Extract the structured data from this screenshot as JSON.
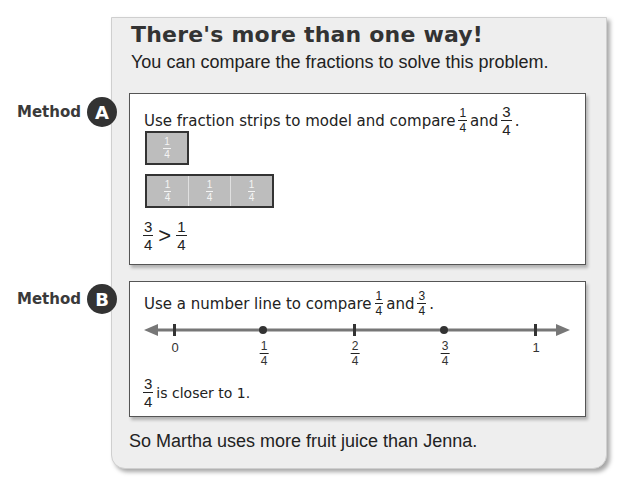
{
  "panel": {
    "title": "There's more than one way!",
    "subtitle": "You can compare the fractions to solve this problem.",
    "footer": "So Martha uses more fruit juice than Jenna."
  },
  "method_a": {
    "label_word": "Method",
    "badge": "A",
    "instruction_prefix": "Use fraction strips to model and compare",
    "instruction_mid": "and",
    "instruction_suffix": ".",
    "fraction1": {
      "num": "1",
      "den": "4"
    },
    "fraction2": {
      "num": "3",
      "den": "4"
    },
    "strip_one": [
      {
        "num": "1",
        "den": "4"
      }
    ],
    "strip_three": [
      {
        "num": "1",
        "den": "4"
      },
      {
        "num": "1",
        "den": "4"
      },
      {
        "num": "1",
        "den": "4"
      }
    ],
    "comparison": {
      "left": {
        "num": "3",
        "den": "4"
      },
      "operator": ">",
      "right": {
        "num": "1",
        "den": "4"
      }
    }
  },
  "method_b": {
    "label_word": "Method",
    "badge": "B",
    "instruction_prefix": "Use a number line to compare",
    "instruction_mid": "and",
    "instruction_suffix": ".",
    "fraction1": {
      "num": "1",
      "den": "4"
    },
    "fraction2": {
      "num": "3",
      "den": "4"
    },
    "number_line": {
      "ticks": [
        {
          "label": "0",
          "type": "tick"
        },
        {
          "num": "1",
          "den": "4",
          "type": "point"
        },
        {
          "num": "2",
          "den": "4",
          "type": "tick"
        },
        {
          "num": "3",
          "den": "4",
          "type": "point"
        },
        {
          "label": "1",
          "type": "tick"
        }
      ]
    },
    "conclusion_fraction": {
      "num": "3",
      "den": "4"
    },
    "conclusion_text": "is closer to 1."
  },
  "colors": {
    "panel_bg": "#eeeeee",
    "badge_bg": "#333333",
    "strip_fill": "#bdbdbd",
    "line_color": "#777777"
  }
}
